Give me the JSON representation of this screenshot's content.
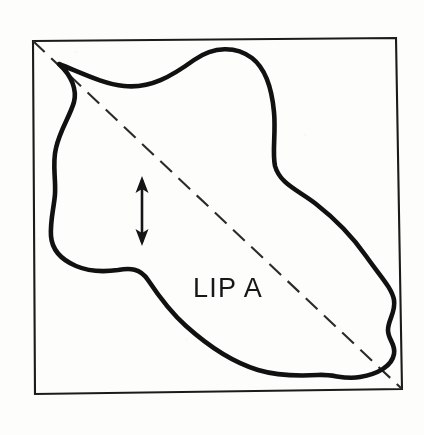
{
  "figure": {
    "type": "technical-line-drawing",
    "caption_text": "LIP A",
    "background_color": "#fdfdfc",
    "ink_color": "#111111",
    "canvas": {
      "width": 424,
      "height": 435
    }
  },
  "frame": {
    "name": "bounding-square",
    "stroke_color": "#1b1b1b",
    "stroke_width": 2.1,
    "corners": {
      "top_left": [
        33,
        41
      ],
      "top_right": [
        396,
        38
      ],
      "bottom_right": [
        402,
        389
      ],
      "bottom_left": [
        35,
        394
      ]
    }
  },
  "diagonal": {
    "name": "section-line",
    "style": "dashed",
    "stroke_color": "#2a2a2a",
    "stroke_width": 2.1,
    "dash_length": 16,
    "gap_length": 9,
    "start": [
      33,
      41
    ],
    "end": [
      402,
      389
    ]
  },
  "blob": {
    "name": "lip-a-outline",
    "stroke_color": "#111111",
    "stroke_width": 4.6,
    "closed": true,
    "cusp_point": [
      59,
      64
    ],
    "path": "M 59 64 C 84 74, 104 84, 124 86 C 150 89, 172 76, 194 60 C 214 46, 236 46, 252 58 C 266 69, 272 90, 274 112 C 276 134, 272 152, 275 166 C 280 184, 298 190, 316 204 C 334 218, 352 236, 366 256 C 380 276, 392 288, 394 300 C 396 312, 388 320, 388 330 C 388 340, 396 344, 394 354 C 392 366, 378 374, 360 377 C 344 380, 334 374, 318 375 C 300 376, 278 376, 258 370 C 232 362, 206 344, 186 326 C 168 310, 156 292, 148 280 C 140 268, 130 268, 118 270 C 104 272, 90 272, 76 266 C 62 260, 52 250, 51 236 C 50 220, 54 208, 55 194 C 56 178, 52 164, 56 148 C 60 130, 70 116, 74 102 C 77 90, 72 76, 59 64 Z"
  },
  "thickness_arrow": {
    "name": "thickness-indicator",
    "orientation": "vertical",
    "double_headed": true,
    "stroke_color": "#151515",
    "x": 142,
    "top_y": 176,
    "bottom_y": 246
  },
  "label": {
    "text": "LIP A",
    "x": 193,
    "baseline_y": 297,
    "font_size": 27,
    "color": "#171717"
  }
}
